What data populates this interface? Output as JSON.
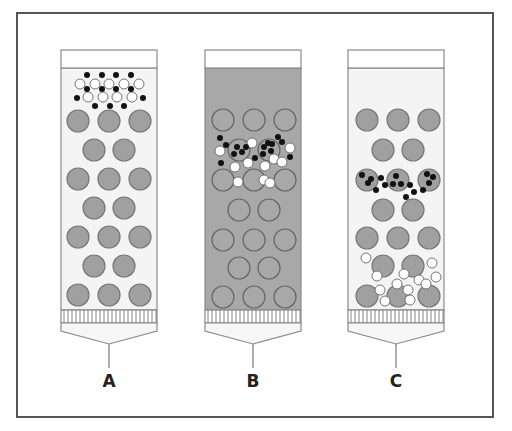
{
  "colors": {
    "frame": "#555555",
    "column_outline": "#8a8a8a",
    "column_fill_light": "#f4f4f4",
    "column_fill_dark": "#a8a8a8",
    "header_fill": "#ffffff",
    "bead_fill": "#a0a0a0",
    "bead_stroke": "#777777",
    "black_dot": "#111111",
    "white_dot": "#ffffff",
    "white_dot_stroke": "#666666"
  },
  "columns": [
    {
      "label": "A",
      "x": 61,
      "fill": "light",
      "beads": [
        [
          78,
          121
        ],
        [
          109,
          121
        ],
        [
          140,
          121
        ],
        [
          94,
          150
        ],
        [
          124,
          150
        ],
        [
          78,
          179
        ],
        [
          109,
          179
        ],
        [
          140,
          179
        ],
        [
          94,
          208
        ],
        [
          124,
          208
        ],
        [
          78,
          237
        ],
        [
          109,
          237
        ],
        [
          140,
          237
        ],
        [
          94,
          266
        ],
        [
          124,
          266
        ],
        [
          78,
          295
        ],
        [
          109,
          295
        ],
        [
          140,
          295
        ]
      ],
      "bead_style": "filled",
      "white_dots": [
        [
          80,
          84
        ],
        [
          95,
          84
        ],
        [
          109,
          84
        ],
        [
          124,
          84
        ],
        [
          139,
          84
        ],
        [
          88,
          97
        ],
        [
          103,
          97
        ],
        [
          117,
          97
        ],
        [
          132,
          97
        ]
      ],
      "black_dots": [
        [
          87,
          75
        ],
        [
          102,
          75
        ],
        [
          116,
          75
        ],
        [
          131,
          75
        ],
        [
          87,
          89
        ],
        [
          102,
          89
        ],
        [
          116,
          89
        ],
        [
          131,
          89
        ],
        [
          77,
          98
        ],
        [
          143,
          98
        ],
        [
          95,
          106
        ],
        [
          110,
          106
        ],
        [
          124,
          106
        ]
      ],
      "inner_dots": []
    },
    {
      "label": "B",
      "x": 205,
      "fill": "dark",
      "beads": [
        [
          223,
          120
        ],
        [
          254,
          120
        ],
        [
          285,
          120
        ],
        [
          239,
          150
        ],
        [
          269,
          150
        ],
        [
          223,
          180
        ],
        [
          254,
          180
        ],
        [
          285,
          180
        ],
        [
          239,
          210
        ],
        [
          269,
          210
        ],
        [
          223,
          240
        ],
        [
          254,
          240
        ],
        [
          285,
          240
        ],
        [
          239,
          268
        ],
        [
          269,
          268
        ],
        [
          223,
          297
        ],
        [
          254,
          297
        ],
        [
          285,
          297
        ]
      ],
      "bead_style": "outline",
      "white_dots": [
        [
          220,
          151
        ],
        [
          252,
          143
        ],
        [
          290,
          148
        ],
        [
          235,
          167
        ],
        [
          248,
          163
        ],
        [
          265,
          166
        ],
        [
          274,
          159
        ],
        [
          282,
          162
        ],
        [
          264,
          180
        ],
        [
          238,
          182
        ],
        [
          270,
          183
        ]
      ],
      "black_dots": [
        [
          220,
          138
        ],
        [
          226,
          145
        ],
        [
          221,
          163
        ],
        [
          246,
          147
        ],
        [
          263,
          154
        ],
        [
          255,
          158
        ],
        [
          282,
          142
        ],
        [
          290,
          157
        ],
        [
          278,
          137
        ]
      ],
      "inner_dots": [
        [
          237,
          147
        ],
        [
          242,
          152
        ],
        [
          234,
          154
        ],
        [
          264,
          147
        ],
        [
          271,
          151
        ],
        [
          268,
          143
        ],
        [
          272,
          144
        ]
      ]
    },
    {
      "label": "C",
      "x": 348,
      "fill": "light",
      "beads": [
        [
          367,
          120
        ],
        [
          398,
          120
        ],
        [
          429,
          120
        ],
        [
          383,
          150
        ],
        [
          413,
          150
        ],
        [
          367,
          180
        ],
        [
          398,
          180
        ],
        [
          429,
          180
        ],
        [
          383,
          210
        ],
        [
          413,
          210
        ],
        [
          367,
          238
        ],
        [
          398,
          238
        ],
        [
          429,
          238
        ],
        [
          383,
          266
        ],
        [
          413,
          266
        ],
        [
          367,
          296
        ],
        [
          398,
          296
        ],
        [
          429,
          296
        ]
      ],
      "bead_style": "filled",
      "white_dots": [
        [
          366,
          258
        ],
        [
          432,
          263
        ],
        [
          377,
          276
        ],
        [
          404,
          274
        ],
        [
          397,
          284
        ],
        [
          419,
          280
        ],
        [
          436,
          277
        ],
        [
          380,
          290
        ],
        [
          408,
          290
        ],
        [
          426,
          284
        ],
        [
          385,
          301
        ],
        [
          410,
          300
        ]
      ],
      "black_dots": [
        [
          381,
          178
        ],
        [
          385,
          185
        ],
        [
          376,
          190
        ],
        [
          410,
          185
        ],
        [
          414,
          192
        ],
        [
          406,
          197
        ],
        [
          423,
          190
        ]
      ],
      "inner_dots": [
        [
          362,
          175
        ],
        [
          368,
          183
        ],
        [
          396,
          176
        ],
        [
          393,
          184
        ],
        [
          401,
          184
        ],
        [
          427,
          174
        ],
        [
          433,
          177
        ],
        [
          429,
          183
        ],
        [
          371,
          179
        ]
      ]
    }
  ],
  "geometry": {
    "col_width": 96,
    "top_y": 50,
    "header_bottom_y": 68,
    "frit_top_y": 310,
    "frit_bottom_y": 323,
    "funnel_apex_y": 344,
    "stem_bottom_y": 368,
    "bead_radius": 11,
    "dot_radius": 3,
    "white_dot_radius": 5
  },
  "labels": [
    "A",
    "B",
    "C"
  ]
}
